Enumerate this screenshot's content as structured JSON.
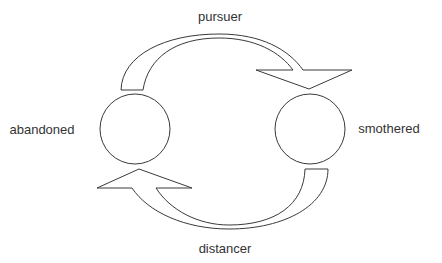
{
  "diagram": {
    "title": "",
    "nodes": [
      {
        "id": "abandoned",
        "label": "abandoned",
        "cx": 135,
        "cy": 129,
        "r": 35,
        "label_x": 42,
        "label_y": 129
      },
      {
        "id": "smothered",
        "label": "smothered",
        "cx": 310,
        "cy": 129,
        "r": 35,
        "label_x": 389,
        "label_y": 128
      }
    ],
    "edges": [
      {
        "id": "pursuer",
        "label": "pursuer",
        "from": "abandoned",
        "to": "smothered",
        "direction": "clockwise-top",
        "label_x": 220,
        "label_y": 16
      },
      {
        "id": "distancer",
        "label": "distancer",
        "from": "smothered",
        "to": "abandoned",
        "direction": "clockwise-bottom",
        "label_x": 225,
        "label_y": 248
      }
    ],
    "colors": {
      "stroke": "#3a3a3a",
      "fill": "#ffffff",
      "text": "#333333",
      "background": "#ffffff"
    }
  }
}
